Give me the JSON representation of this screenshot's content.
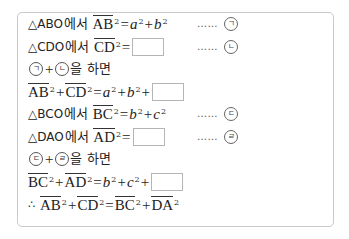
{
  "proof": {
    "lines": [
      {
        "triangle": "△ABO",
        "suffix": "에서",
        "segment": "AB",
        "exp": "2",
        "rhs_a": "a",
        "rhs_a_exp": "2",
        "plus": "+",
        "rhs_b": "b",
        "rhs_b_exp": "2",
        "equals": "=",
        "marker": "ㄱ",
        "dots": "……"
      },
      {
        "triangle": "△CDO",
        "suffix": "에서",
        "segment": "CD",
        "exp": "2",
        "equals": "=",
        "blank": "",
        "marker": "ㄴ",
        "dots": "……"
      },
      {
        "m1": "ㄱ",
        "plus": "+",
        "m2": "ㄴ",
        "text": "을 하면"
      },
      {
        "seg1": "AB",
        "seg2": "CD",
        "exp": "2",
        "plus": "+",
        "equals": "=",
        "rhs_a": "a",
        "rhs_b": "b",
        "blank": ""
      },
      {
        "triangle": "△BCO",
        "suffix": "에서",
        "segment": "BC",
        "exp": "2",
        "equals": "=",
        "rhs_b": "b",
        "rhs_c": "c",
        "plus": "+",
        "marker": "ㄷ",
        "dots": "……"
      },
      {
        "triangle": "△DAO",
        "suffix": "에서",
        "segment": "AD",
        "exp": "2",
        "equals": "=",
        "blank": "",
        "marker": "ㄹ",
        "dots": "……"
      },
      {
        "m1": "ㄷ",
        "plus": "+",
        "m2": "ㄹ",
        "text": "을 하면"
      },
      {
        "seg1": "BC",
        "seg2": "AD",
        "exp": "2",
        "plus": "+",
        "equals": "=",
        "rhs_b": "b",
        "rhs_c": "c",
        "blank": ""
      },
      {
        "therefore": "∴",
        "seg1": "AB",
        "seg2": "CD",
        "seg3": "BC",
        "seg4": "DA",
        "exp": "2",
        "plus": "+",
        "equals": "="
      }
    ]
  }
}
